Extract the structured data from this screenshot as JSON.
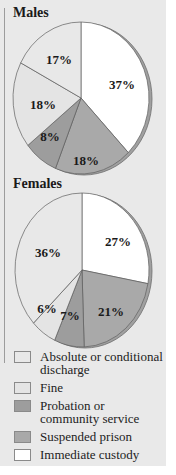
{
  "chart_data": [
    {
      "type": "pie",
      "title": "Males",
      "categories": [
        "Immediate custody",
        "Suspended prison",
        "Probation or community service",
        "Fine",
        "Absolute or conditional discharge"
      ],
      "values": [
        37,
        18,
        8,
        18,
        17
      ],
      "labels": [
        "37%",
        "18%",
        "8%",
        "18%",
        "17%"
      ],
      "start_angle": "12 o'clock, clockwise"
    },
    {
      "type": "pie",
      "title": "Females",
      "categories": [
        "Immediate custody",
        "Suspended prison",
        "Probation or community service",
        "Fine",
        "Absolute or conditional discharge"
      ],
      "values": [
        27,
        21,
        7,
        6,
        36
      ],
      "labels": [
        "27%",
        "21%",
        "7%",
        "6%",
        "36%"
      ],
      "start_angle": "12 o'clock, clockwise"
    }
  ],
  "charts": {
    "males": {
      "title": "Males"
    },
    "females": {
      "title": "Females"
    }
  },
  "colors": {
    "Immediate custody": "#ffffff",
    "Suspended prison": "#a9a9a9",
    "Probation or community service": "#9d9d9d",
    "Fine": "#e4e4e4",
    "Absolute or conditional discharge": "#e8e8e8",
    "rim": "#a0a0a0",
    "panel": "#e9e9e9"
  },
  "legend": {
    "items": [
      {
        "label": "Absolute or conditional discharge",
        "color": "#e8e8e8"
      },
      {
        "label": "Fine",
        "color": "#e4e4e4"
      },
      {
        "label": "Probation or community service",
        "color": "#9d9d9d"
      },
      {
        "label": "Suspended prison",
        "color": "#a9a9a9"
      },
      {
        "label": "Immediate custody",
        "color": "#ffffff"
      }
    ]
  }
}
